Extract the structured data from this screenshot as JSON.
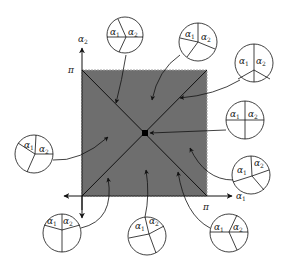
{
  "diagram": {
    "axes": {
      "x_label": "α1",
      "x_label_base": "α",
      "x_label_sub": "1",
      "y_label": "α2",
      "y_label_base": "α",
      "y_label_sub": "2",
      "x_tick": "π",
      "y_tick": "π"
    },
    "square": {
      "fill": "#6e6e6e",
      "edge": "#9a9a9a"
    },
    "circle_label_1_base": "α",
    "circle_label_1_sub": "1",
    "circle_label_2_base": "α",
    "circle_label_2_sub": "2",
    "circles": [
      {
        "id": "top-left",
        "description": "three sectors, α1 and α2 split by horizontal line"
      },
      {
        "id": "top-mid",
        "description": "three sectors, tilted"
      },
      {
        "id": "top-right",
        "description": "three sectors, vertical divider"
      },
      {
        "id": "right-center",
        "description": "four quadrants (cross)"
      },
      {
        "id": "right-lower",
        "description": "unequal sectors"
      },
      {
        "id": "bottom-right",
        "description": "horizontal split with wedge"
      },
      {
        "id": "bottom-mid",
        "description": "unequal sectors"
      },
      {
        "id": "bottom-left",
        "description": "three sectors with vertical line"
      },
      {
        "id": "left",
        "description": "unequal sectors"
      }
    ]
  }
}
